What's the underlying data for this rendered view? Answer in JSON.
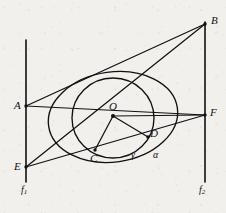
{
  "figure": {
    "type": "geometry-diagram",
    "canvas": {
      "width": 226,
      "height": 213
    },
    "stroke_color": "#111111",
    "background_color": "#f2f0ec"
  },
  "points": [
    {
      "id": "A",
      "label": "A",
      "x": 26,
      "y": 106,
      "label_x": 14,
      "label_y": 100
    },
    {
      "id": "B",
      "label": "B",
      "x": 205,
      "y": 24,
      "label_x": 211,
      "label_y": 15
    },
    {
      "id": "C",
      "label": "C",
      "x": 95,
      "y": 150,
      "label_x": 90,
      "label_y": 153
    },
    {
      "id": "D",
      "label": "D",
      "x": 148,
      "y": 137,
      "label_x": 150,
      "label_y": 128
    },
    {
      "id": "E",
      "label": "E",
      "x": 26,
      "y": 167,
      "label_x": 14,
      "label_y": 161
    },
    {
      "id": "F",
      "label": "F",
      "x": 205,
      "y": 115,
      "label_x": 210,
      "label_y": 107
    },
    {
      "id": "O",
      "label": "O",
      "x": 113,
      "y": 116,
      "label_x": 109,
      "label_y": 101
    }
  ],
  "curve_labels": [
    {
      "id": "alpha",
      "label": "α",
      "x": 153,
      "y": 150
    },
    {
      "id": "gamma",
      "label": "γ",
      "x": 131,
      "y": 150
    }
  ],
  "axis_labels": [
    {
      "id": "f1",
      "label": "f",
      "sub": "1",
      "x": 21,
      "y": 185
    },
    {
      "id": "f2",
      "label": "f",
      "sub": "2",
      "x": 199,
      "y": 185
    }
  ],
  "vertical_lines": [
    {
      "id": "f1-line",
      "x": 26,
      "y1": 40,
      "y2": 182
    },
    {
      "id": "f2-line",
      "x": 205,
      "y1": 22,
      "y2": 182
    }
  ],
  "segments": [
    {
      "id": "A-B",
      "x1": 26,
      "y1": 106,
      "x2": 205,
      "y2": 24
    },
    {
      "id": "A-F",
      "x1": 26,
      "y1": 106,
      "x2": 205,
      "y2": 115
    },
    {
      "id": "E-B",
      "x1": 26,
      "y1": 167,
      "x2": 205,
      "y2": 24
    },
    {
      "id": "E-F",
      "x1": 26,
      "y1": 167,
      "x2": 205,
      "y2": 115
    },
    {
      "id": "O-F",
      "x1": 113,
      "y1": 116,
      "x2": 205,
      "y2": 115
    },
    {
      "id": "O-C",
      "x1": 113,
      "y1": 116,
      "x2": 95,
      "y2": 150
    },
    {
      "id": "O-D",
      "x1": 113,
      "y1": 116,
      "x2": 148,
      "y2": 137
    }
  ],
  "ellipses": [
    {
      "id": "alpha-ellipse",
      "cx": 113,
      "cy": 117,
      "rx": 65,
      "ry": 45,
      "rotation": -8
    },
    {
      "id": "gamma-circle",
      "cx": 113,
      "cy": 118,
      "rx": 41,
      "ry": 40,
      "rotation": 0
    }
  ]
}
